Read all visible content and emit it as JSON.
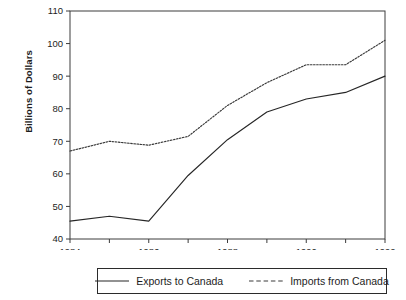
{
  "chart_data": {
    "type": "line",
    "title": "",
    "xlabel": "",
    "ylabel": "Billions of Dollars",
    "x": [
      1984,
      1985,
      1986,
      1987,
      1988,
      1989,
      1990,
      1991,
      1992
    ],
    "xlim": [
      1984,
      1992
    ],
    "ylim": [
      40,
      110
    ],
    "yticks": [
      40,
      50,
      60,
      70,
      80,
      90,
      100,
      110
    ],
    "xticks": [
      1984,
      1986,
      1988,
      1990,
      1992
    ],
    "xticks_minor": [
      1985,
      1987,
      1989,
      1991
    ],
    "grid": false,
    "legend_position": "bottom",
    "series": [
      {
        "name": "Exports to Canada",
        "style": "solid",
        "color": "#262626",
        "values": [
          45.5,
          47.0,
          45.5,
          59.5,
          70.5,
          79.0,
          83.0,
          85.0,
          90.0
        ]
      },
      {
        "name": "Imports from Canada",
        "style": "dashed",
        "color": "#3a3a3a",
        "values": [
          67.0,
          70.0,
          68.8,
          71.5,
          81.0,
          88.0,
          93.5,
          93.5,
          101.0
        ]
      }
    ],
    "ytick_labels": [
      "40",
      "50",
      "60",
      "70",
      "80",
      "90",
      "100",
      "110"
    ],
    "xtick_labels": [
      "1984",
      "1986",
      "1988",
      "1990",
      "1992"
    ]
  },
  "legend": {
    "items": [
      {
        "label": "Exports to Canada",
        "swatch": "solid-line-icon"
      },
      {
        "label": "Imports from Canada",
        "swatch": "dashed-line-icon"
      }
    ]
  }
}
